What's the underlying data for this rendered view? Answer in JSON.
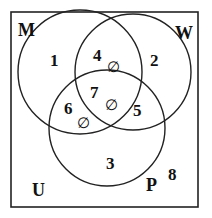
{
  "diagram": {
    "type": "venn-3",
    "universe_label": "U",
    "sets": [
      {
        "id": "M",
        "label": "M"
      },
      {
        "id": "W",
        "label": "W"
      },
      {
        "id": "P",
        "label": "P"
      }
    ],
    "regions": [
      {
        "number": "1",
        "sets": [
          "M"
        ],
        "empty": false
      },
      {
        "number": "2",
        "sets": [
          "W"
        ],
        "empty": false
      },
      {
        "number": "3",
        "sets": [
          "P"
        ],
        "empty": false
      },
      {
        "number": "4",
        "sets": [
          "M",
          "W"
        ],
        "empty": true
      },
      {
        "number": "5",
        "sets": [
          "W",
          "P"
        ],
        "empty": false
      },
      {
        "number": "6",
        "sets": [
          "M",
          "P"
        ],
        "empty": true
      },
      {
        "number": "7",
        "sets": [
          "M",
          "W",
          "P"
        ],
        "empty": true
      },
      {
        "number": "8",
        "sets": [],
        "empty": false
      }
    ],
    "empty_symbol": "∅"
  }
}
